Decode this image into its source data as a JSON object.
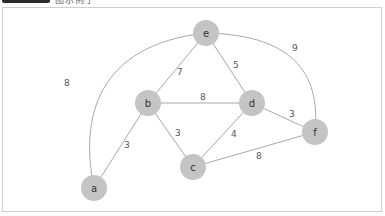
{
  "header": {
    "badge_color": "#2b2b2b",
    "text": "图示例子"
  },
  "colors": {
    "node_fill": "#c4c4c4",
    "edge_stroke": "#a8a8a8",
    "frame_border": "#cfcfcf"
  },
  "graph": {
    "nodes": [
      {
        "id": "a",
        "label": "a",
        "x": 94,
        "y": 188
      },
      {
        "id": "b",
        "label": "b",
        "x": 148,
        "y": 103
      },
      {
        "id": "c",
        "label": "c",
        "x": 193,
        "y": 167
      },
      {
        "id": "d",
        "label": "d",
        "x": 252,
        "y": 103
      },
      {
        "id": "e",
        "label": "e",
        "x": 206,
        "y": 33
      },
      {
        "id": "f",
        "label": "f",
        "x": 315,
        "y": 132
      }
    ],
    "edges": [
      {
        "from": "a",
        "to": "e",
        "weight": "8",
        "curved": true
      },
      {
        "from": "a",
        "to": "b",
        "weight": "3"
      },
      {
        "from": "b",
        "to": "e",
        "weight": "7"
      },
      {
        "from": "b",
        "to": "d",
        "weight": "8"
      },
      {
        "from": "b",
        "to": "c",
        "weight": "3"
      },
      {
        "from": "e",
        "to": "d",
        "weight": "5"
      },
      {
        "from": "e",
        "to": "f",
        "weight": "9",
        "curved": true
      },
      {
        "from": "d",
        "to": "c",
        "weight": "4"
      },
      {
        "from": "d",
        "to": "f",
        "weight": "3"
      },
      {
        "from": "c",
        "to": "f",
        "weight": "8"
      }
    ]
  }
}
